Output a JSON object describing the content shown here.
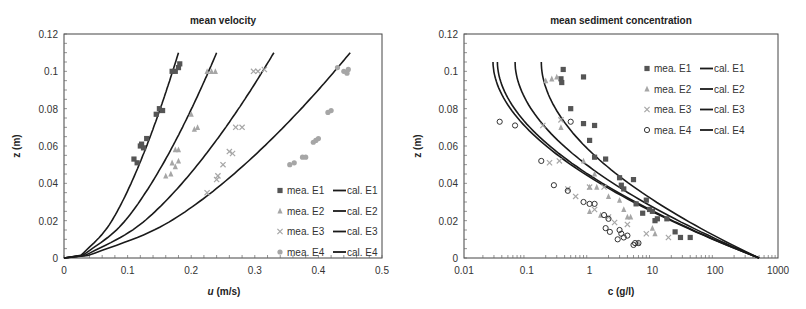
{
  "chart_data": [
    {
      "type": "scatter",
      "title": "mean velocity",
      "xlabel": "u (m/s)",
      "ylabel": "z (m)",
      "xlim": [
        0,
        0.5
      ],
      "ylim": [
        0,
        0.12
      ],
      "xticks": [
        "0",
        "0.1",
        "0.2",
        "0.3",
        "0.4",
        "0.5"
      ],
      "yticks": [
        "0",
        "0.02",
        "0.04",
        "0.06",
        "0.08",
        "0.1",
        "0.12"
      ],
      "grid": false,
      "legend_position": "lower right",
      "legend": [
        "mea. E1",
        "cal. E1",
        "mea. E2",
        "cal. E2",
        "mea. E3",
        "cal. E3",
        "mea. E4",
        "cal. E4"
      ],
      "series": [
        {
          "name": "mea. E1",
          "marker": "square",
          "color": "#555555",
          "points": [
            [
              0.11,
              0.053
            ],
            [
              0.115,
              0.051
            ],
            [
              0.12,
              0.06
            ],
            [
              0.122,
              0.061
            ],
            [
              0.125,
              0.059
            ],
            [
              0.13,
              0.064
            ],
            [
              0.145,
              0.077
            ],
            [
              0.15,
              0.08
            ],
            [
              0.155,
              0.079
            ],
            [
              0.17,
              0.1
            ],
            [
              0.175,
              0.1
            ],
            [
              0.18,
              0.102
            ],
            [
              0.182,
              0.104
            ]
          ]
        },
        {
          "name": "mea. E2",
          "marker": "triangle",
          "color": "#a6a6a6",
          "points": [
            [
              0.16,
              0.044
            ],
            [
              0.168,
              0.045
            ],
            [
              0.17,
              0.051
            ],
            [
              0.175,
              0.049
            ],
            [
              0.18,
              0.052
            ],
            [
              0.175,
              0.058
            ],
            [
              0.18,
              0.058
            ],
            [
              0.2,
              0.077
            ],
            [
              0.205,
              0.069
            ],
            [
              0.21,
              0.07
            ],
            [
              0.225,
              0.1
            ],
            [
              0.232,
              0.1
            ],
            [
              0.238,
              0.1
            ]
          ]
        },
        {
          "name": "mea. E3",
          "marker": "x",
          "color": "#a6a6a6",
          "points": [
            [
              0.225,
              0.035
            ],
            [
              0.24,
              0.042
            ],
            [
              0.242,
              0.044
            ],
            [
              0.25,
              0.05
            ],
            [
              0.26,
              0.057
            ],
            [
              0.265,
              0.056
            ],
            [
              0.27,
              0.07
            ],
            [
              0.28,
              0.07
            ],
            [
              0.298,
              0.1
            ],
            [
              0.305,
              0.1
            ],
            [
              0.315,
              0.101
            ]
          ]
        },
        {
          "name": "mea. E4",
          "marker": "circle",
          "color": "#a6a6a6",
          "points": [
            [
              0.355,
              0.05
            ],
            [
              0.362,
              0.051
            ],
            [
              0.375,
              0.054
            ],
            [
              0.38,
              0.054
            ],
            [
              0.392,
              0.062
            ],
            [
              0.396,
              0.063
            ],
            [
              0.4,
              0.064
            ],
            [
              0.415,
              0.078
            ],
            [
              0.42,
              0.079
            ],
            [
              0.43,
              0.102
            ],
            [
              0.44,
              0.1
            ],
            [
              0.445,
              0.099
            ],
            [
              0.447,
              0.101
            ]
          ]
        },
        {
          "name": "cal. E1",
          "line": true,
          "color": "#1a1a1a",
          "u_max": 0.18
        },
        {
          "name": "cal. E2",
          "line": true,
          "color": "#1a1a1a",
          "u_max": 0.24
        },
        {
          "name": "cal. E3",
          "line": true,
          "color": "#1a1a1a",
          "u_max": 0.33
        },
        {
          "name": "cal. E4",
          "line": true,
          "color": "#1a1a1a",
          "u_max": 0.45
        }
      ]
    },
    {
      "type": "scatter",
      "title": "mean sediment concentration",
      "xlabel": "c (g/l)",
      "ylabel": "z (m)",
      "xscale": "log",
      "xlim": [
        0.01,
        1000
      ],
      "ylim": [
        0,
        0.12
      ],
      "xticks": [
        "0.01",
        "0.1",
        "1",
        "10",
        "100",
        "1000"
      ],
      "yticks": [
        "0",
        "0.02",
        "0.04",
        "0.06",
        "0.08",
        "0.1",
        "0.12"
      ],
      "grid": false,
      "legend_position": "upper right",
      "legend": [
        "mea. E1",
        "cal. E1",
        "mea. E2",
        "cal. E2",
        "mea. E3",
        "cal. E3",
        "mea. E4",
        "cal. E4"
      ],
      "series": [
        {
          "name": "mea. E1",
          "marker": "square",
          "color": "#555555",
          "points": [
            [
              0.38,
              0.101
            ],
            [
              0.35,
              0.096
            ],
            [
              0.36,
              0.094
            ],
            [
              0.8,
              0.097
            ],
            [
              0.5,
              0.08
            ],
            [
              0.8,
              0.072
            ],
            [
              1.2,
              0.071
            ],
            [
              1.0,
              0.063
            ],
            [
              1.2,
              0.054
            ],
            [
              1.8,
              0.053
            ],
            [
              3,
              0.043
            ],
            [
              3.2,
              0.039
            ],
            [
              3.5,
              0.037
            ],
            [
              5,
              0.042
            ],
            [
              5.5,
              0.029
            ],
            [
              8,
              0.031
            ],
            [
              7,
              0.024
            ],
            [
              9,
              0.026
            ],
            [
              10,
              0.025
            ],
            [
              11,
              0.02
            ],
            [
              12,
              0.021
            ],
            [
              17,
              0.021
            ],
            [
              23,
              0.014
            ],
            [
              28,
              0.011
            ],
            [
              40,
              0.011
            ]
          ]
        },
        {
          "name": "mea. E2",
          "marker": "triangle",
          "color": "#a6a6a6",
          "points": [
            [
              0.2,
              0.095
            ],
            [
              0.25,
              0.096
            ],
            [
              0.3,
              0.097
            ],
            [
              0.35,
              0.07
            ],
            [
              0.8,
              0.052
            ],
            [
              1.2,
              0.045
            ],
            [
              1.0,
              0.038
            ],
            [
              1.3,
              0.038
            ],
            [
              2,
              0.033
            ],
            [
              3,
              0.031
            ],
            [
              3.5,
              0.026
            ],
            [
              4,
              0.022
            ],
            [
              4.5,
              0.022
            ],
            [
              1,
              0.025
            ],
            [
              1.5,
              0.023
            ],
            [
              10,
              0.016
            ],
            [
              11,
              0.013
            ],
            [
              6,
              0.008
            ]
          ]
        },
        {
          "name": "mea. E3",
          "marker": "x",
          "color": "#a6a6a6",
          "points": [
            [
              0.18,
              0.071
            ],
            [
              0.35,
              0.074
            ],
            [
              0.23,
              0.051
            ],
            [
              0.33,
              0.052
            ],
            [
              0.45,
              0.037
            ],
            [
              0.6,
              0.033
            ],
            [
              1.0,
              0.038
            ],
            [
              1.7,
              0.038
            ],
            [
              1.2,
              0.026
            ],
            [
              2.0,
              0.022
            ],
            [
              2.5,
              0.019
            ],
            [
              4,
              0.018
            ],
            [
              8,
              0.013
            ],
            [
              18,
              0.011
            ]
          ]
        },
        {
          "name": "mea. E4",
          "marker": "circle-open",
          "color": "#333333",
          "points": [
            [
              0.037,
              0.073
            ],
            [
              0.065,
              0.071
            ],
            [
              0.5,
              0.073
            ],
            [
              0.17,
              0.052
            ],
            [
              0.27,
              0.039
            ],
            [
              0.45,
              0.036
            ],
            [
              0.8,
              0.03
            ],
            [
              1.0,
              0.029
            ],
            [
              1.2,
              0.029
            ],
            [
              1.7,
              0.023
            ],
            [
              2.0,
              0.021
            ],
            [
              1.8,
              0.016
            ],
            [
              2.1,
              0.014
            ],
            [
              3,
              0.015
            ],
            [
              3.2,
              0.013
            ],
            [
              3.5,
              0.011
            ],
            [
              4,
              0.012
            ],
            [
              2.8,
              0.01
            ],
            [
              5,
              0.007
            ],
            [
              5.3,
              0.008
            ],
            [
              6,
              0.008
            ]
          ]
        },
        {
          "name": "cal. E1",
          "line": true,
          "color": "#1a1a1a",
          "c_top": 0.17
        },
        {
          "name": "cal. E2",
          "line": true,
          "color": "#1a1a1a",
          "c_top": 0.065
        },
        {
          "name": "cal. E3",
          "line": true,
          "color": "#1a1a1a",
          "c_top": 0.034
        },
        {
          "name": "cal. E4",
          "line": true,
          "color": "#1a1a1a",
          "c_top": 0.029
        }
      ]
    }
  ],
  "left": {
    "title": "mean velocity",
    "xlabel_var": "u",
    "xlabel_unit": " (m/s)",
    "ylabel": "z (m)",
    "xticks": [
      "0",
      "0.1",
      "0.2",
      "0.3",
      "0.4",
      "0.5"
    ],
    "yticks": [
      "0",
      "0.02",
      "0.04",
      "0.06",
      "0.08",
      "0.1",
      "0.12"
    ],
    "legend": [
      {
        "mea": "mea. E1",
        "cal": "cal. E1"
      },
      {
        "mea": "mea. E2",
        "cal": "cal. E2"
      },
      {
        "mea": "mea. E3",
        "cal": "cal. E3"
      },
      {
        "mea": "mea. E4",
        "cal": "cal. E4"
      }
    ]
  },
  "right": {
    "title": "mean sediment concentration",
    "xlabel": "c (g/l)",
    "ylabel": "z (m)",
    "xticks": [
      "0.01",
      "0.1",
      "1",
      "10",
      "100",
      "1000"
    ],
    "yticks": [
      "0",
      "0.02",
      "0.04",
      "0.06",
      "0.08",
      "0.1",
      "0.12"
    ],
    "legend": [
      {
        "mea": "mea. E1",
        "cal": "cal. E1"
      },
      {
        "mea": "mea. E2",
        "cal": "cal. E2"
      },
      {
        "mea": "mea. E3",
        "cal": "cal. E3"
      },
      {
        "mea": "mea. E4",
        "cal": "cal. E4"
      }
    ]
  }
}
